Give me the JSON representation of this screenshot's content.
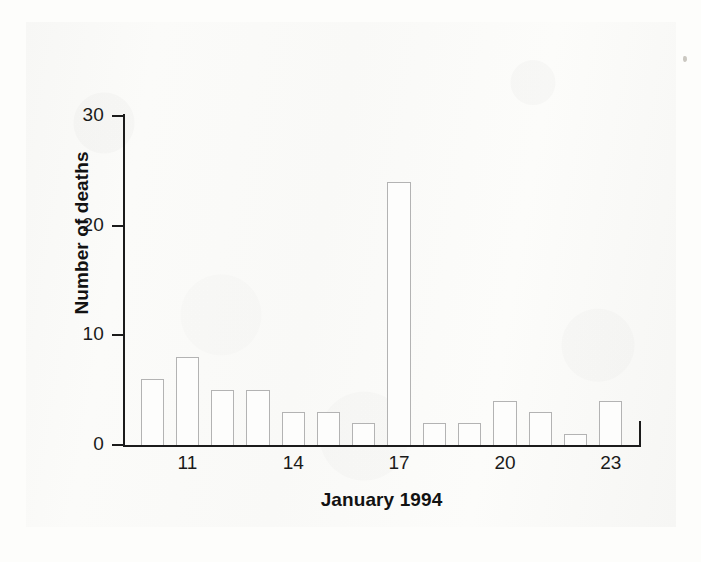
{
  "figure": {
    "kind": "epidemic-curve-histogram",
    "background_color": "#f9f9f7",
    "bar_outline_color": "#b3b3b3",
    "bar_fill_color": "#fdfdfc",
    "axis_color": "#1b1b1b"
  },
  "chart_data": {
    "type": "bar",
    "title": "",
    "xlabel": "January 1994",
    "ylabel": "Number of deaths",
    "categories": [
      "10",
      "11",
      "12",
      "13",
      "14",
      "15",
      "16",
      "17",
      "18",
      "19",
      "20",
      "21",
      "22",
      "23"
    ],
    "values": [
      6,
      8,
      5,
      5,
      3,
      3,
      2,
      24,
      2,
      2,
      4,
      3,
      1,
      4
    ],
    "x_tick_labels": [
      "11",
      "14",
      "17",
      "20",
      "23"
    ],
    "x_tick_categories": [
      "11",
      "14",
      "17",
      "20",
      "23"
    ],
    "y_tick_labels": [
      "0",
      "10",
      "20",
      "30"
    ],
    "y_tick_values": [
      0,
      10,
      20,
      30
    ],
    "ylim": [
      0,
      30
    ],
    "xlim_categories": [
      "10",
      "23"
    ],
    "grid": false,
    "legend": false,
    "legend_position": "none"
  }
}
